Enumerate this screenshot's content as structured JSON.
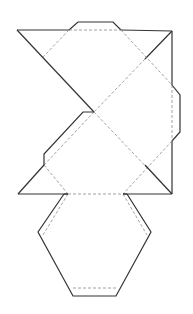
{
  "diagram": {
    "type": "geometric-net",
    "colors": {
      "cut_line": "#333333",
      "fold_line": "#8a8a8a",
      "background": "#ffffff"
    },
    "line_styles": {
      "cut": "solid",
      "fold": "dashed"
    }
  }
}
